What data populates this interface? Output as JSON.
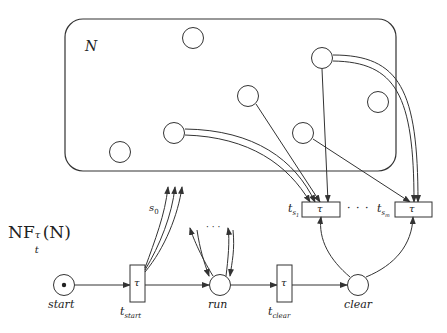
{
  "diagram": {
    "title": "NF",
    "title_sup": "τ",
    "title_sub": "t",
    "title_arg": "(N)",
    "net_label": "N",
    "tau": "τ",
    "dots": "· · ·",
    "s0": "s",
    "s0_sub": "0",
    "places": [
      {
        "id": "start",
        "label": "start",
        "marked": true
      },
      {
        "id": "run",
        "label": "run",
        "marked": false
      },
      {
        "id": "clear",
        "label": "clear",
        "marked": false
      }
    ],
    "transitions": [
      {
        "id": "t_start",
        "label": "t",
        "sub": "start"
      },
      {
        "id": "t_clear",
        "label": "t",
        "sub": "clear"
      },
      {
        "id": "t_s1",
        "label": "t",
        "sub": "s",
        "subsub": "1"
      },
      {
        "id": "t_sm",
        "label": "t",
        "sub": "s",
        "subsub": "m"
      }
    ],
    "colors": {
      "stroke": "#333333",
      "background": "#ffffff"
    }
  }
}
